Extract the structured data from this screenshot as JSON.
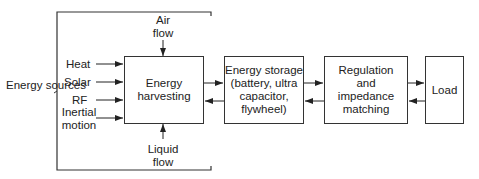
{
  "diagram": {
    "group_label": "Energy sources",
    "inputs": {
      "heat": "Heat",
      "solar": "Solar",
      "rf": "RF",
      "inertial": "Inertial motion",
      "air": "Air flow",
      "liquid": "Liquid flow"
    },
    "blocks": {
      "harvesting": "Energy harvesting",
      "storage": "Energy storage (battery, ultra capacitor, flywheel)",
      "regulation": "Regulation and impedance matching",
      "load": "Load"
    }
  }
}
